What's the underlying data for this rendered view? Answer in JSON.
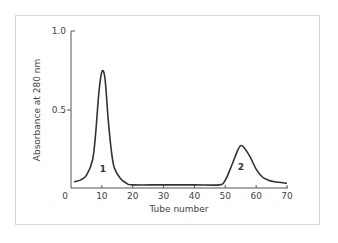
{
  "chart_data": {
    "type": "line",
    "title": "",
    "xlabel": "Tube number",
    "ylabel": "Absorbance at 280 nm",
    "xlim": [
      0,
      70
    ],
    "ylim": [
      0,
      1.0
    ],
    "x_ticks": [
      0,
      10,
      20,
      30,
      40,
      50,
      60,
      70
    ],
    "x_tick_labels": [
      "0",
      "10",
      "20",
      "30",
      "40",
      "50",
      "60",
      "70"
    ],
    "y_ticks": [
      0.5,
      1.0
    ],
    "y_tick_labels": [
      "0.5",
      "1.0"
    ],
    "grid": false,
    "legend": null,
    "series": [
      {
        "name": "Absorbance",
        "x": [
          1,
          3,
          5,
          7,
          8,
          9,
          10,
          11,
          12,
          13,
          14,
          16,
          18,
          20,
          30,
          40,
          48,
          50,
          52,
          54,
          55,
          56,
          58,
          60,
          62,
          64,
          66,
          70
        ],
        "y": [
          0.04,
          0.05,
          0.08,
          0.18,
          0.35,
          0.6,
          0.74,
          0.7,
          0.45,
          0.25,
          0.13,
          0.06,
          0.03,
          0.02,
          0.02,
          0.02,
          0.02,
          0.05,
          0.14,
          0.24,
          0.27,
          0.26,
          0.2,
          0.12,
          0.07,
          0.05,
          0.04,
          0.03
        ]
      }
    ],
    "annotations": [
      {
        "text": "1",
        "x": 10,
        "y": 0.13
      },
      {
        "text": "2",
        "x": 55,
        "y": 0.13
      }
    ]
  },
  "labels": {
    "x_axis": "Tube number",
    "y_axis": "Absorbance at 280 nm",
    "peak1": "1",
    "peak2": "2",
    "x_ticks": [
      "0",
      "10",
      "20",
      "30",
      "40",
      "50",
      "60",
      "70"
    ],
    "y_ticks": [
      "0.5",
      "1.0"
    ]
  }
}
